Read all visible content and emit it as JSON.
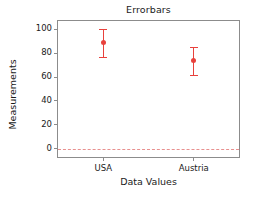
{
  "chart_data": {
    "type": "scatter",
    "title": "Errorbars",
    "xlabel": "Data Values",
    "ylabel": "Measurements",
    "categories": [
      "USA",
      "Austria"
    ],
    "values": [
      89,
      73.5
    ],
    "err_low": [
      77,
      61.5
    ],
    "err_high": [
      100,
      85
    ],
    "yticks": [
      0,
      20,
      40,
      60,
      80,
      100
    ],
    "ytick_labels": [
      "0",
      "20",
      "40",
      "60",
      "80",
      "100"
    ],
    "ylim": [
      -7,
      107
    ],
    "xlim": [
      0,
      1
    ],
    "grid": false,
    "legend": "none",
    "series": [
      {
        "name": "Measurements",
        "color": "#e8413c",
        "points": [
          {
            "category": "USA",
            "value": 89,
            "low": 77,
            "high": 100
          },
          {
            "category": "Austria",
            "value": 73.5,
            "low": 61.5,
            "high": 85
          }
        ]
      }
    ],
    "annotations": [
      {
        "type": "hline",
        "name": "zero-reference-line",
        "value": 0,
        "style": "dashed",
        "color": "#e8908f"
      }
    ]
  }
}
